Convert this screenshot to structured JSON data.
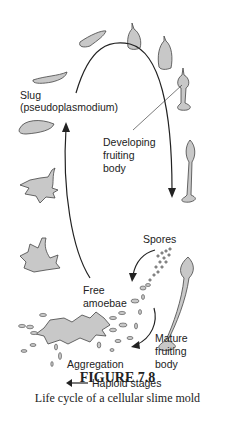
{
  "figure": {
    "number": "FIGURE 7.8",
    "caption": "Life cycle of a cellular slime mold"
  },
  "labels": {
    "slug": "Slug",
    "slug_sub": "(pseudoplasmodium)",
    "developing_1": "Developing",
    "developing_2": "fruiting",
    "developing_3": "body",
    "spores": "Spores",
    "free_1": "Free",
    "free_2": "amoebae",
    "mature_1": "Mature",
    "mature_2": "fruiting",
    "mature_3": "body",
    "aggregation": "Aggregation",
    "haploid": "Haploid stages"
  },
  "colors": {
    "fill": "#c8c8c8",
    "stroke": "#333333",
    "text": "#222222"
  }
}
